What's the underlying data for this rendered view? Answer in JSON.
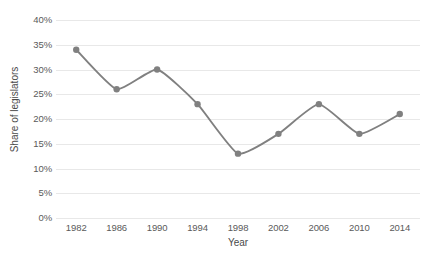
{
  "chart_data": {
    "type": "line",
    "title": "",
    "xlabel": "Year",
    "ylabel": "Share of legislators",
    "categories": [
      "1982",
      "1986",
      "1990",
      "1994",
      "1998",
      "2002",
      "2006",
      "2010",
      "2014"
    ],
    "values": [
      34,
      26,
      30,
      23,
      13,
      17,
      23,
      17,
      21
    ],
    "value_suffix": "%",
    "ylim": [
      0,
      40
    ],
    "ytick_values": [
      0,
      5,
      10,
      15,
      20,
      25,
      30,
      35,
      40
    ],
    "ytick_labels": [
      "0%",
      "5%",
      "10%",
      "15%",
      "20%",
      "25%",
      "30%",
      "35%",
      "40%"
    ],
    "grid": true,
    "legend": "none",
    "series_color": "#808080",
    "gridline_color": "#e8e8e8",
    "smoothing": "spline",
    "marker": "circle"
  }
}
